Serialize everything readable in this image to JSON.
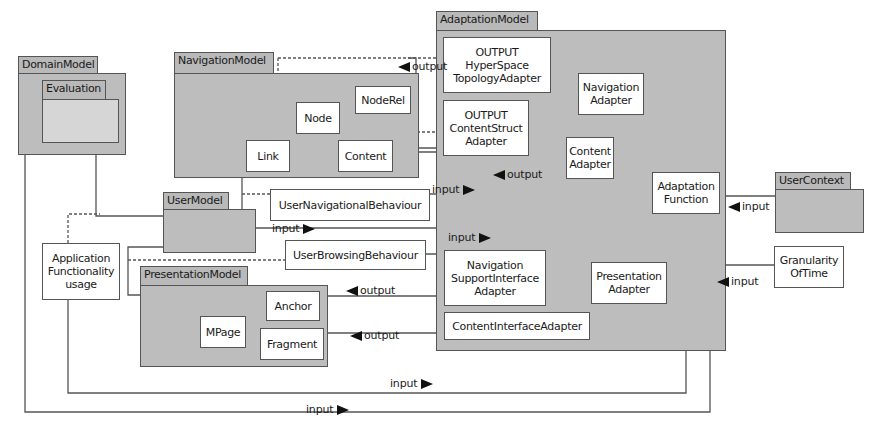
{
  "packages": {
    "domain_model": {
      "label": "DomainModel",
      "nested": {
        "label": "Evaluation"
      }
    },
    "navigation_model": {
      "label": "NavigationModel",
      "classes": [
        "NodeRel",
        "Node",
        "Link",
        "Content"
      ]
    },
    "adaptation_model": {
      "label": "AdaptationModel"
    },
    "user_model": {
      "label": "UserModel"
    },
    "presentation_model": {
      "label": "PresentationModel",
      "classes": [
        "Anchor",
        "MPage",
        "Fragment"
      ]
    },
    "user_context": {
      "label": "UserContext"
    }
  },
  "classes": {
    "noderel": "NodeRel",
    "node": "Node",
    "link": "Link",
    "content": "Content",
    "hyperspace_line1": "OUTPUT",
    "hyperspace_line2": "HyperSpace",
    "hyperspace_line3": "TopologyAdapter",
    "contentstruct_line1": "OUTPUT",
    "contentstruct_line2": "ContentStruct",
    "contentstruct_line3": "Adapter",
    "navadapter_line1": "Navigation",
    "navadapter_line2": "Adapter",
    "contentadapter_line1": "Content",
    "contentadapter_line2": "Adapter",
    "adaptfn_line1": "Adaptation",
    "adaptfn_line2": "Function",
    "user_nav_behaviour": "UserNavigationalBehaviour",
    "user_browsing_behaviour": "UserBrowsingBehaviour",
    "navsupport_line1": "Navigation",
    "navsupport_line2": "SupportInterface",
    "navsupport_line3": "Adapter",
    "presadapter_line1": "Presentation",
    "presadapter_line2": "Adapter",
    "content_interface_adapter": "ContentInterfaceAdapter",
    "anchor": "Anchor",
    "mpage": "MPage",
    "fragment": "Fragment",
    "app_func_line1": "Application",
    "app_func_line2": "Functionality",
    "app_func_line3": "usage",
    "granularity_line1": "Granularity",
    "granularity_line2": "OfTime"
  },
  "labels": {
    "output_top": "output",
    "output_content": "output",
    "input_unb": "input",
    "input_um": "input",
    "input_ubb": "input",
    "input_uc": "input",
    "input_gran": "input",
    "output_anchor": "output",
    "output_fragment": "output",
    "input_bottom1": "input",
    "input_bottom2": "input"
  },
  "colors": {
    "package_fill": "#bdbdbd",
    "class_fill": "#ffffff",
    "line": "#555555"
  }
}
